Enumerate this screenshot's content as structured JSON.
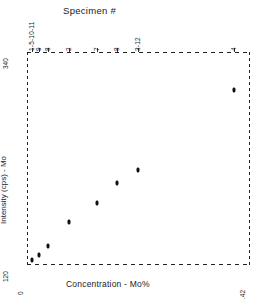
{
  "chart_data": {
    "type": "scatter",
    "title": "",
    "top_axis_title": "Specimen #",
    "xlabel": "Concentration - Mo%",
    "ylabel": "Intensity (cps) - Mo",
    "xlim": [
      0,
      0.42
    ],
    "ylim": [
      120,
      340
    ],
    "x_tick_labels": [
      "0",
      ".42"
    ],
    "y_tick_labels": [
      "340",
      "120"
    ],
    "grid": false,
    "legend": "none",
    "points": [
      {
        "specimen": "1-5-10-11",
        "x": 0.01,
        "y": 124
      },
      {
        "specimen": "9",
        "x": 0.022,
        "y": 129
      },
      {
        "specimen": "8",
        "x": 0.04,
        "y": 139
      },
      {
        "specimen": "2",
        "x": 0.079,
        "y": 164
      },
      {
        "specimen": "7",
        "x": 0.133,
        "y": 183
      },
      {
        "specimen": "8b",
        "x": 0.171,
        "y": 204
      },
      {
        "specimen": "3-12",
        "x": 0.21,
        "y": 218
      },
      {
        "specimen": "4",
        "x": 0.391,
        "y": 301
      }
    ],
    "top_tick_labels": [
      {
        "label": "1-5-10-11",
        "x": 0.01
      },
      {
        "label": "9",
        "x": 0.022
      },
      {
        "label": "8",
        "x": 0.04
      },
      {
        "label": "2",
        "x": 0.079
      },
      {
        "label": "7",
        "x": 0.133
      },
      {
        "label": "8",
        "x": 0.171
      },
      {
        "label": "3-12",
        "x": 0.21
      },
      {
        "label": "4",
        "x": 0.391
      }
    ]
  },
  "axes": {
    "top_title": "Specimen #",
    "x_title": "Concentration - Mo%",
    "y_title": "Intensity (cps) - Mo",
    "y_max_label": "340",
    "y_min_label": "120",
    "x_min_label": "0",
    "x_max_label": ".42"
  }
}
